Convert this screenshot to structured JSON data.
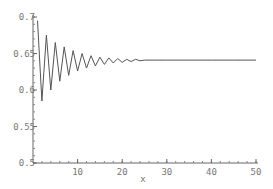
{
  "chart_data": {
    "type": "line",
    "title": "",
    "xlabel": "x",
    "ylabel": "",
    "xlim": [
      1,
      50
    ],
    "ylim": [
      0.5,
      0.7
    ],
    "x_ticks": [
      10,
      20,
      30,
      40,
      50
    ],
    "x_tick_labels": [
      "10",
      "20",
      "30",
      "40",
      "50"
    ],
    "y_ticks": [
      0.5,
      0.55,
      0.6,
      0.65,
      0.7
    ],
    "y_tick_labels": [
      "0.5",
      "0.55",
      "0.6",
      "0.65",
      "0.7"
    ],
    "grid": false,
    "legend": null,
    "series": [
      {
        "name": "damped oscillation",
        "color": "#555555",
        "x": [
          1,
          2,
          3,
          4,
          5,
          6,
          7,
          8,
          9,
          10,
          11,
          12,
          13,
          14,
          15,
          16,
          17,
          18,
          19,
          20,
          21,
          22,
          23,
          24,
          25,
          30,
          35,
          40,
          45,
          50
        ],
        "values": [
          0.695,
          0.585,
          0.675,
          0.6,
          0.665,
          0.612,
          0.659,
          0.62,
          0.654,
          0.626,
          0.65,
          0.63,
          0.647,
          0.633,
          0.645,
          0.635,
          0.644,
          0.637,
          0.643,
          0.638,
          0.642,
          0.639,
          0.642,
          0.64,
          0.641,
          0.641,
          0.641,
          0.641,
          0.641,
          0.641
        ]
      }
    ]
  }
}
